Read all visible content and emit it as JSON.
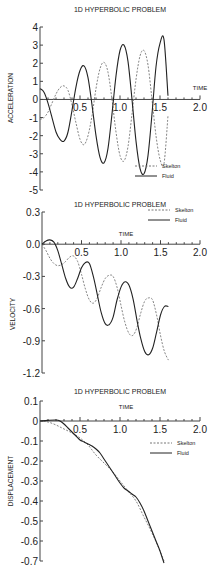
{
  "chart_data": [
    {
      "type": "line",
      "title": "1D HYPERBOLIC PROBLEM",
      "xlabel": "TIME",
      "ylabel": "ACCELERATION",
      "xlim": [
        0,
        2.0
      ],
      "ylim": [
        -5,
        4
      ],
      "xticks": [
        "0.5",
        "1.0",
        "1.5",
        "2.0"
      ],
      "yticks": [
        "4",
        "3",
        "2",
        "1",
        "0",
        "-1",
        "-2",
        "-3",
        "-4",
        "-5"
      ],
      "legend": [
        "Skelton",
        "Fluid"
      ],
      "legend_position": "lower right",
      "grid": false,
      "series": [
        {
          "name": "Skelton",
          "style": "dashed",
          "x": [
            0,
            0.05,
            0.1,
            0.15,
            0.2,
            0.25,
            0.3,
            0.35,
            0.4,
            0.45,
            0.5,
            0.55,
            0.6,
            0.65,
            0.7,
            0.75,
            0.8,
            0.85,
            0.9,
            0.95,
            1.0,
            1.05,
            1.1,
            1.15,
            1.2,
            1.25,
            1.3,
            1.35,
            1.4,
            1.45,
            1.5,
            1.55,
            1.6
          ],
          "y": [
            -1.1,
            -1.0,
            -0.7,
            -0.2,
            0.3,
            0.65,
            0.75,
            0.5,
            -0.3,
            -1.3,
            -2.2,
            -2.5,
            -2.0,
            -0.9,
            0.6,
            1.7,
            2.05,
            1.5,
            0.0,
            -1.8,
            -3.1,
            -3.4,
            -2.6,
            -0.8,
            1.1,
            2.4,
            2.7,
            1.9,
            0.0,
            -2.0,
            -3.3,
            -3.55,
            -0.9
          ]
        },
        {
          "name": "Fluid",
          "style": "solid",
          "x": [
            0,
            0.05,
            0.1,
            0.15,
            0.2,
            0.25,
            0.3,
            0.35,
            0.4,
            0.45,
            0.5,
            0.55,
            0.6,
            0.65,
            0.7,
            0.75,
            0.8,
            0.85,
            0.9,
            0.95,
            1.0,
            1.05,
            1.1,
            1.15,
            1.2,
            1.25,
            1.3,
            1.35,
            1.4,
            1.45,
            1.5,
            1.55,
            1.6
          ],
          "y": [
            0.6,
            0.4,
            -0.2,
            -1.0,
            -1.8,
            -2.2,
            -2.3,
            -1.8,
            -0.6,
            0.7,
            1.6,
            1.85,
            1.2,
            -0.3,
            -2.0,
            -3.2,
            -3.5,
            -2.7,
            -0.8,
            1.3,
            2.7,
            3.0,
            2.1,
            0.0,
            -2.3,
            -3.8,
            -4.1,
            -3.1,
            -0.8,
            1.8,
            3.1,
            3.3,
            0.2
          ]
        }
      ]
    },
    {
      "type": "line",
      "title": "1D HYPERBOLIC PROBLEM",
      "xlabel": "TIME",
      "ylabel": "VELOCITY",
      "xlim": [
        0,
        2.0
      ],
      "ylim": [
        -1.2,
        0.3
      ],
      "xticks": [
        "0.5",
        "1.0",
        "1.5",
        "2.0"
      ],
      "yticks": [
        "0.3",
        "0.0",
        "-0.3",
        "-0.6",
        "-0.9",
        "-1.2"
      ],
      "legend": [
        "Skelton",
        "Fluid"
      ],
      "legend_position": "upper right",
      "grid": false,
      "series": [
        {
          "name": "Skelton",
          "style": "dashed",
          "x": [
            0,
            0.05,
            0.1,
            0.15,
            0.2,
            0.25,
            0.3,
            0.35,
            0.4,
            0.45,
            0.5,
            0.55,
            0.6,
            0.65,
            0.7,
            0.75,
            0.8,
            0.85,
            0.9,
            0.95,
            1.0,
            1.05,
            1.1,
            1.15,
            1.2,
            1.25,
            1.3,
            1.35,
            1.4,
            1.45,
            1.5,
            1.55,
            1.6
          ],
          "y": [
            0.0,
            -0.06,
            -0.13,
            -0.18,
            -0.2,
            -0.19,
            -0.16,
            -0.12,
            -0.11,
            -0.16,
            -0.28,
            -0.42,
            -0.52,
            -0.55,
            -0.5,
            -0.4,
            -0.32,
            -0.29,
            -0.3,
            -0.4,
            -0.57,
            -0.73,
            -0.83,
            -0.85,
            -0.78,
            -0.64,
            -0.53,
            -0.5,
            -0.52,
            -0.66,
            -0.85,
            -1.0,
            -1.08
          ]
        },
        {
          "name": "Fluid",
          "style": "solid",
          "x": [
            0,
            0.05,
            0.1,
            0.15,
            0.2,
            0.25,
            0.3,
            0.35,
            0.4,
            0.45,
            0.5,
            0.55,
            0.6,
            0.65,
            0.7,
            0.75,
            0.8,
            0.85,
            0.9,
            0.95,
            1.0,
            1.05,
            1.1,
            1.15,
            1.2,
            1.25,
            1.3,
            1.35,
            1.4,
            1.45,
            1.5,
            1.55,
            1.6
          ],
          "y": [
            0.0,
            0.03,
            0.04,
            0.02,
            -0.06,
            -0.19,
            -0.32,
            -0.4,
            -0.4,
            -0.32,
            -0.22,
            -0.17,
            -0.18,
            -0.3,
            -0.47,
            -0.64,
            -0.74,
            -0.75,
            -0.68,
            -0.52,
            -0.4,
            -0.35,
            -0.38,
            -0.5,
            -0.7,
            -0.88,
            -1.0,
            -1.03,
            -0.97,
            -0.82,
            -0.66,
            -0.58,
            -0.58
          ]
        }
      ]
    },
    {
      "type": "line",
      "title": "1D HYPERBOLIC PROBLEM",
      "xlabel": "TIME",
      "ylabel": "DISPLACEMENT",
      "xlim": [
        0,
        2.0
      ],
      "ylim": [
        -0.7,
        0.1
      ],
      "xticks": [
        "0.5",
        "1.0",
        "1.5",
        "2.0"
      ],
      "yticks": [
        "0.1",
        "0",
        "-0.1",
        "-0.2",
        "-0.3",
        "-0.4",
        "-0.5",
        "-0.6",
        "-0.7"
      ],
      "legend": [
        "Skelton",
        "Fluid"
      ],
      "legend_position": "upper right",
      "grid": false,
      "series": [
        {
          "name": "Skelton",
          "style": "dashed",
          "x": [
            0,
            0.1,
            0.2,
            0.3,
            0.4,
            0.5,
            0.6,
            0.7,
            0.8,
            0.9,
            1.0,
            1.1,
            1.2,
            1.3,
            1.4,
            1.5,
            1.55
          ],
          "y": [
            0.0,
            -0.005,
            -0.02,
            -0.04,
            -0.06,
            -0.085,
            -0.12,
            -0.17,
            -0.21,
            -0.25,
            -0.3,
            -0.35,
            -0.4,
            -0.48,
            -0.56,
            -0.65,
            -0.7
          ]
        },
        {
          "name": "Fluid",
          "style": "solid",
          "x": [
            0,
            0.1,
            0.2,
            0.25,
            0.3,
            0.35,
            0.4,
            0.45,
            0.5,
            0.55,
            0.6,
            0.65,
            0.7,
            0.75,
            0.8,
            0.85,
            0.9,
            0.95,
            1.0,
            1.05,
            1.1,
            1.15,
            1.2,
            1.25,
            1.3,
            1.35,
            1.4,
            1.45,
            1.5,
            1.55
          ],
          "y": [
            0.0,
            0.003,
            0.005,
            0.0,
            -0.015,
            -0.035,
            -0.055,
            -0.075,
            -0.095,
            -0.105,
            -0.115,
            -0.125,
            -0.14,
            -0.16,
            -0.19,
            -0.22,
            -0.25,
            -0.28,
            -0.31,
            -0.335,
            -0.35,
            -0.365,
            -0.38,
            -0.41,
            -0.45,
            -0.5,
            -0.55,
            -0.6,
            -0.65,
            -0.71
          ]
        }
      ]
    }
  ]
}
